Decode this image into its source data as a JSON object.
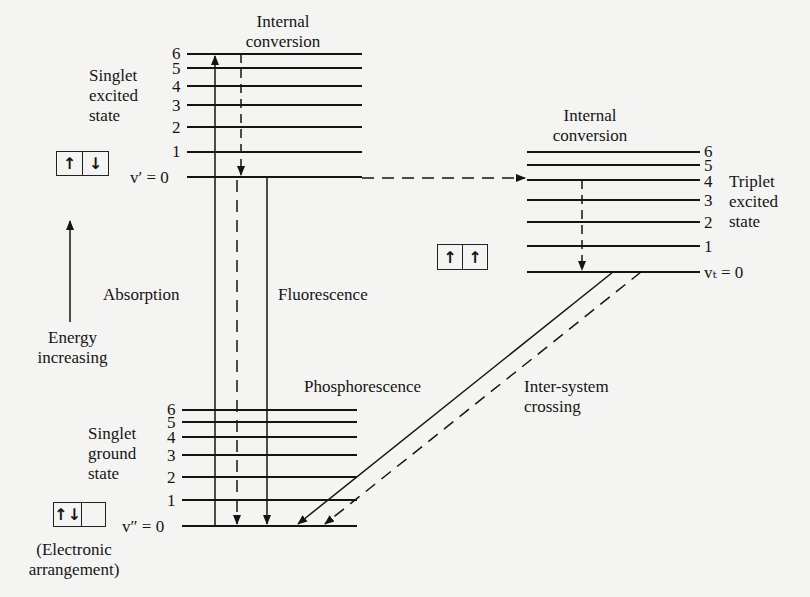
{
  "colors": {
    "ink": "#141414",
    "background": "#f4f4f2"
  },
  "labels": {
    "internal_conversion_singlet": [
      "Internal",
      "conversion"
    ],
    "internal_conversion_triplet": [
      "Internal",
      "conversion"
    ],
    "singlet_excited": [
      "Singlet",
      "excited",
      "state"
    ],
    "singlet_ground": [
      "Singlet",
      "ground",
      "state"
    ],
    "triplet_excited": [
      "Triplet",
      "excited",
      "state"
    ],
    "absorption": "Absorption",
    "fluorescence": "Fluorescence",
    "phosphorescence": "Phosphorescence",
    "intersystem": [
      "Inter-system",
      "crossing"
    ],
    "energy": [
      "Energy",
      "increasing"
    ],
    "electronic": [
      "(Electronic",
      "arrangement)"
    ],
    "v_prime": "v′ = 0",
    "v_double_prime": "v″ = 0",
    "v_t": "vₜ = 0"
  },
  "levels": {
    "singlet_excited": [
      "6",
      "5",
      "4",
      "3",
      "2",
      "1"
    ],
    "singlet_ground": [
      "6",
      "5",
      "4",
      "3",
      "2",
      "1"
    ],
    "triplet_excited": [
      "6",
      "5",
      "4",
      "3",
      "2",
      "1"
    ]
  },
  "electron_boxes": {
    "singlet_excited": [
      "↑",
      "↓"
    ],
    "triplet_excited": [
      "↑",
      "↑"
    ],
    "singlet_ground": [
      "↑↓",
      ""
    ]
  }
}
